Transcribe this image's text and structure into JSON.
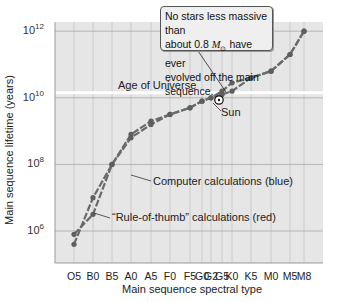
{
  "chart_data": {
    "type": "line",
    "title": "",
    "xlabel": "Main sequence spectral type",
    "ylabel": "Main sequence lifetime (years)",
    "yscale": "log",
    "ylim_exp": [
      5.2,
      12.5
    ],
    "categories": [
      "O5",
      "B0",
      "B5",
      "A0",
      "A5",
      "F0",
      "F5",
      "G0",
      "G2",
      "G5",
      "K0",
      "K5",
      "M0",
      "M5",
      "M8"
    ],
    "y_ticks": [
      {
        "exp": 6,
        "label": "10",
        "sup": "6"
      },
      {
        "exp": 8,
        "label": "10",
        "sup": "8"
      },
      {
        "exp": 10,
        "label": "10",
        "sup": "10"
      },
      {
        "exp": 12,
        "label": "10",
        "sup": "12"
      }
    ],
    "series": [
      {
        "name": "Computer calculations (blue)",
        "color": "#6a6a6a",
        "values_log10": [
          5.6,
          7.0,
          8.0,
          8.9,
          9.3,
          9.5,
          9.7,
          9.9,
          10.0,
          10.2,
          10.45,
          10.6,
          10.8,
          11.3,
          12.0
        ]
      },
      {
        "name": "\"Rule-of-thumb\" calculations (red)",
        "color": "#6a6a6a",
        "values_log10": [
          5.9,
          6.5,
          8.0,
          8.8,
          9.2,
          9.5,
          9.7,
          9.9,
          10.0,
          10.1,
          10.2,
          10.6,
          10.8,
          11.3,
          12.0
        ]
      }
    ],
    "reference_lines": [
      {
        "label": "Age of Universe",
        "y_log10": 10.15,
        "color": "#ffffff"
      }
    ],
    "annotations": [
      {
        "text": "No stars less massive than about 0.8 M⊙ have ever evolved off the main sequence.",
        "type": "callout"
      },
      {
        "text": "Sun",
        "at": "G2"
      },
      {
        "text": "Computer calculations (blue)",
        "series": 0
      },
      {
        "text": "“Rule-of-thumb” calculations (red)",
        "series": 1
      }
    ],
    "grid": true,
    "legend": "none"
  },
  "labels": {
    "age_of_universe": "Age of Universe",
    "sun": "Sun",
    "computer": "Computer calculations (blue)",
    "rule": "“Rule-of-thumb” calculations (red)",
    "callout_line1": "No stars less massive than",
    "callout_line2a": "about 0.8 ",
    "callout_mass": "M",
    "callout_sun": "⊙",
    "callout_line2b": " have ever",
    "callout_line3": "evolved off the main sequence."
  }
}
